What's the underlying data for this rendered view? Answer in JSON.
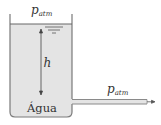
{
  "diagram": {
    "type": "tank-with-outlet-pipe",
    "top_pressure": {
      "symbol": "p",
      "subscript": "atm"
    },
    "outlet_pressure": {
      "symbol": "p",
      "subscript": "atm"
    },
    "height_label": "h",
    "fluid_label": "Água",
    "colors": {
      "water": "#e4e4e4",
      "wall": "#7a7a7a",
      "text": "#333333",
      "pipe": "#8a8a8a"
    }
  }
}
